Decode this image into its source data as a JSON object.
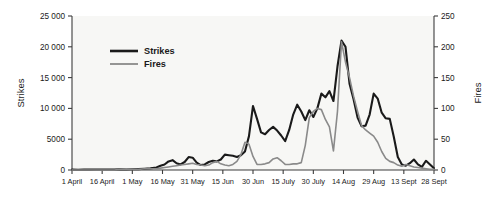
{
  "chart_data": {
    "type": "line",
    "title": "",
    "xlabel": "",
    "ylabel": "Strikes",
    "y2label": "Fires",
    "ylim": [
      0,
      25000
    ],
    "y2lim": [
      0,
      250
    ],
    "grid": false,
    "legend_position": "top-left-inside",
    "y_ticks": [
      "0",
      "5000",
      "10 000",
      "15 000",
      "20 000",
      "25 000"
    ],
    "y_tick_values": [
      0,
      5000,
      10000,
      15000,
      20000,
      25000
    ],
    "y2_ticks": [
      "0",
      "50",
      "100",
      "150",
      "200",
      "250"
    ],
    "y2_tick_values": [
      0,
      50,
      100,
      150,
      200,
      250
    ],
    "x_ticks": [
      "1 April",
      "16 April",
      "1 May",
      "16 May",
      "31 May",
      "15 Jun",
      "30 Jun",
      "15 July",
      "30 July",
      "14 Aug",
      "29 Aug",
      "13 Sept",
      "28 Sept"
    ],
    "x_tick_positions": [
      0,
      15,
      30,
      45,
      60,
      75,
      90,
      105,
      120,
      135,
      150,
      165,
      180
    ],
    "x_range": [
      0,
      180
    ],
    "series": [
      {
        "name": "Strikes",
        "color": "#1a1a1a",
        "width": 2.1,
        "axis": "left",
        "x": [
          0,
          3,
          6,
          9,
          12,
          15,
          18,
          21,
          24,
          27,
          30,
          33,
          36,
          39,
          42,
          44,
          46,
          48,
          50,
          52,
          54,
          56,
          58,
          60,
          62,
          64,
          66,
          68,
          70,
          72,
          74,
          76,
          78,
          80,
          82,
          84,
          86,
          88,
          90,
          92,
          94,
          96,
          98,
          100,
          102,
          104,
          106,
          108,
          110,
          112,
          114,
          116,
          118,
          120,
          122,
          124,
          126,
          128,
          130,
          132,
          134,
          136,
          138,
          140,
          142,
          144,
          146,
          148,
          150,
          152,
          154,
          156,
          158,
          160,
          162,
          164,
          166,
          168,
          170,
          172,
          174,
          176,
          178,
          180
        ],
        "values": [
          60,
          50,
          70,
          60,
          80,
          70,
          90,
          80,
          100,
          90,
          120,
          150,
          200,
          260,
          400,
          700,
          900,
          1400,
          1600,
          1100,
          900,
          1300,
          2100,
          2000,
          1200,
          800,
          900,
          1300,
          1500,
          1400,
          1700,
          2500,
          2400,
          2300,
          2100,
          2400,
          3000,
          5500,
          10400,
          8300,
          6100,
          5800,
          6500,
          7000,
          6400,
          5600,
          4700,
          6500,
          9000,
          10600,
          9500,
          8100,
          9700,
          8600,
          10000,
          12400,
          11800,
          12800,
          11200,
          16800,
          21000,
          20000,
          14000,
          11500,
          8500,
          7100,
          7200,
          9000,
          12400,
          11600,
          9300,
          8400,
          8300,
          5400,
          2100,
          900,
          700,
          1100,
          1700,
          900,
          500,
          1500,
          900,
          300
        ]
      },
      {
        "name": "Fires",
        "color": "#8a8a8a",
        "width": 1.6,
        "axis": "right",
        "x": [
          0,
          3,
          6,
          9,
          12,
          15,
          18,
          21,
          24,
          27,
          30,
          33,
          36,
          39,
          42,
          44,
          46,
          48,
          50,
          52,
          54,
          56,
          58,
          60,
          62,
          64,
          66,
          68,
          70,
          72,
          74,
          76,
          78,
          80,
          82,
          84,
          86,
          88,
          90,
          92,
          94,
          96,
          98,
          100,
          102,
          104,
          106,
          108,
          110,
          112,
          114,
          116,
          118,
          120,
          122,
          124,
          126,
          128,
          130,
          132,
          134,
          136,
          138,
          140,
          142,
          144,
          146,
          148,
          150,
          152,
          154,
          156,
          158,
          160,
          162,
          164,
          166,
          168,
          170,
          172,
          174,
          176,
          178,
          180
        ],
        "values": [
          0,
          0,
          0,
          0,
          0,
          0,
          0,
          0,
          1,
          1,
          1,
          1,
          2,
          2,
          2,
          3,
          4,
          5,
          6,
          7,
          8,
          9,
          10,
          11,
          9,
          8,
          7,
          8,
          12,
          14,
          10,
          8,
          7,
          9,
          14,
          25,
          45,
          42,
          22,
          9,
          9,
          10,
          12,
          18,
          20,
          15,
          9,
          9,
          10,
          10,
          12,
          40,
          85,
          95,
          100,
          98,
          82,
          70,
          31,
          95,
          208,
          175,
          150,
          120,
          95,
          72,
          65,
          60,
          55,
          45,
          30,
          19,
          14,
          12,
          8,
          6,
          9,
          7,
          5,
          4,
          3,
          2,
          1,
          1
        ]
      }
    ],
    "legend": [
      {
        "label": "Strikes",
        "color": "#1a1a1a",
        "width": 2.6
      },
      {
        "label": "Fires",
        "color": "#8a8a8a",
        "width": 1.8
      }
    ]
  }
}
